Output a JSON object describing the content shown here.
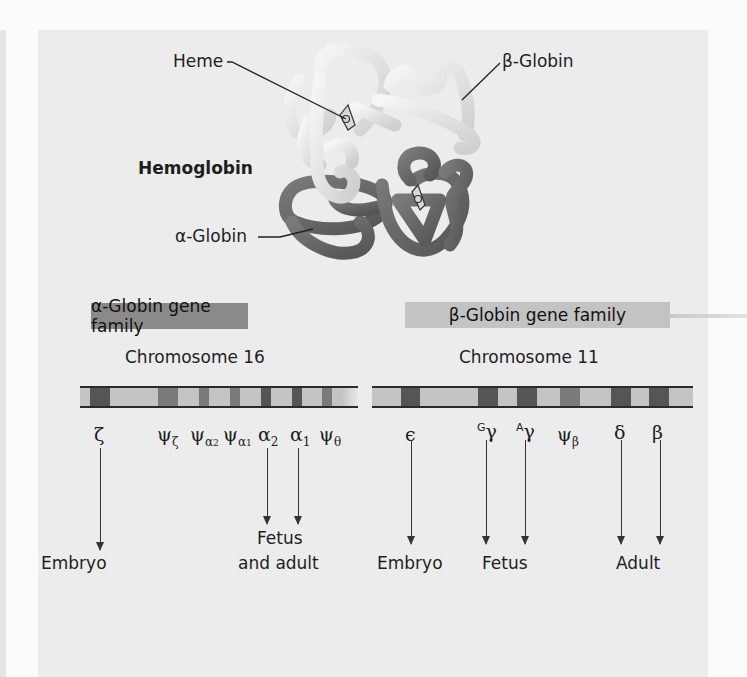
{
  "figure": {
    "protein": {
      "title": "Hemoglobin",
      "labels": {
        "heme": "Heme",
        "beta_globin": "β-Globin",
        "alpha_globin": "α-Globin"
      }
    },
    "alpha_family": {
      "header": "α-Globin gene family",
      "chromosome": "Chromosome 16",
      "genes": [
        {
          "symbol": "ζ",
          "sub": ""
        },
        {
          "symbol": "ψ",
          "sub": "ζ"
        },
        {
          "symbol": "ψ",
          "sub": "α2"
        },
        {
          "symbol": "ψ",
          "sub": "α1"
        },
        {
          "symbol": "α",
          "sub": "2"
        },
        {
          "symbol": "α",
          "sub": "1"
        },
        {
          "symbol": "ψ",
          "sub": "θ"
        }
      ],
      "stages": {
        "embryo": "Embryo",
        "fetus_adult_line1": "Fetus",
        "fetus_adult_line2": "and adult"
      }
    },
    "beta_family": {
      "header": "β-Globin gene family",
      "chromosome": "Chromosome 11",
      "genes": [
        {
          "symbol": "ϵ",
          "sup": ""
        },
        {
          "symbol": "γ",
          "sup": "G"
        },
        {
          "symbol": "γ",
          "sup": "A"
        },
        {
          "symbol": "ψ",
          "sub": "β"
        },
        {
          "symbol": "δ"
        },
        {
          "symbol": "β"
        }
      ],
      "stages": {
        "embryo": "Embryo",
        "fetus": "Fetus",
        "adult": "Adult"
      }
    }
  },
  "colors": {
    "panel": "#ececec",
    "alpha_header": "#8a8a8a",
    "beta_header": "#c3c3c3",
    "band_dark": "#5a5a5a",
    "band_mid": "#7c7c7c",
    "chromosome_light": "#c4c4c4",
    "globin_light": "#e4e4e4",
    "globin_dark": "#6e6e6e"
  }
}
